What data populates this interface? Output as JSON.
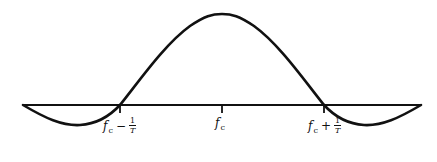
{
  "diagram": {
    "type": "sinc-shaped spectrum (main lobe with side lobes)",
    "colors": {
      "stroke": "#111111",
      "background": "#ffffff"
    },
    "labels": {
      "left": {
        "base": "f",
        "sub": "c",
        "op": "−",
        "num": "1",
        "den": "T"
      },
      "center": {
        "base": "f",
        "sub": "c"
      },
      "right": {
        "base": "f",
        "sub": "c",
        "op": "+",
        "num": "1",
        "den": "T"
      }
    }
  }
}
